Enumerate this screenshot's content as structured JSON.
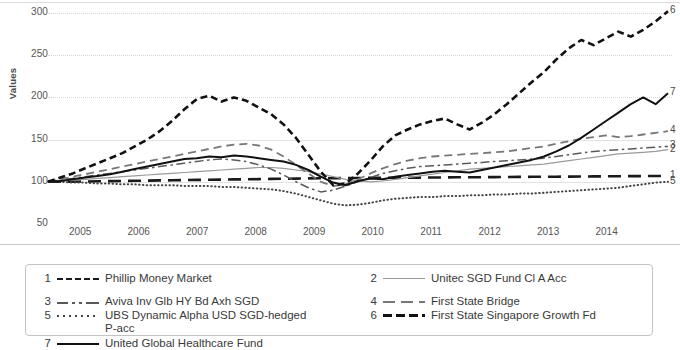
{
  "chart_data": {
    "type": "line",
    "title": "",
    "xlabel": "",
    "ylabel": "Values",
    "ylim": [
      50,
      300
    ],
    "yticks": [
      50,
      100,
      150,
      200,
      250,
      300
    ],
    "xticks": [
      "2005",
      "2006",
      "2007",
      "2008",
      "2009",
      "2010",
      "2011",
      "2012",
      "2013",
      "2014"
    ],
    "grid": true,
    "legend_position": "bottom",
    "x_start": "2004",
    "x_end": "2015",
    "series": [
      {
        "name": "Phillip Money Market",
        "number": "1",
        "style": "long-dash",
        "color": "#1a1a1a",
        "end_label": "1",
        "end_value": 107,
        "values": [
          100,
          100,
          100.2,
          100.4,
          100.6,
          100.8,
          101,
          101.2,
          101.4,
          101.6,
          101.8,
          102,
          102.2,
          102.4,
          102.6,
          102.8,
          103,
          103.2,
          103.4,
          103.6,
          103.8,
          104,
          104.2,
          104.3,
          104.4,
          104.5,
          104.6,
          104.7,
          104.8,
          104.9,
          105,
          105.1,
          105.2,
          105.3,
          105.4,
          105.5,
          105.6,
          105.7,
          105.8,
          105.9,
          106,
          106.1,
          106.2,
          106.3,
          106.4,
          106.5,
          106.6,
          106.7,
          106.8,
          106.9,
          107
        ]
      },
      {
        "name": "Unitec SGD Fund Cl A Acc",
        "number": "2",
        "style": "thin-solid",
        "color": "#9a9a9a",
        "end_label": "2",
        "end_value": 138,
        "values": [
          100,
          101,
          102,
          103,
          104,
          105,
          106,
          107,
          108,
          109,
          110,
          111,
          112,
          113,
          114,
          115,
          116,
          117,
          117,
          116,
          114,
          112,
          109,
          106,
          103,
          101,
          100,
          101,
          103,
          105,
          107,
          109,
          111,
          113,
          115,
          116,
          117,
          118,
          119,
          120,
          121,
          123,
          125,
          127,
          129,
          131,
          133,
          134,
          135,
          136,
          138
        ]
      },
      {
        "name": "Aviva Inv Glb HY Bd Axh SGD",
        "number": "3",
        "style": "dash-dot",
        "color": "#5a5a5a",
        "end_label": "3",
        "end_value": 142,
        "values": [
          100,
          102,
          104,
          106,
          108,
          110,
          112,
          114,
          116,
          118,
          120,
          122,
          124,
          126,
          127,
          126,
          124,
          120,
          115,
          108,
          100,
          93,
          88,
          90,
          95,
          100,
          105,
          110,
          113,
          116,
          118,
          119,
          120,
          121,
          122,
          123,
          124,
          125,
          126,
          127,
          128,
          130,
          132,
          134,
          136,
          137,
          138,
          139,
          140,
          141,
          142
        ]
      },
      {
        "name": "First State Bridge",
        "number": "4",
        "style": "med-dash",
        "color": "#777777",
        "end_label": "4",
        "end_value": 160,
        "values": [
          100,
          103,
          106,
          109,
          112,
          115,
          118,
          121,
          124,
          127,
          130,
          133,
          136,
          139,
          142,
          144,
          145,
          143,
          138,
          130,
          120,
          110,
          100,
          95,
          97,
          103,
          110,
          116,
          121,
          125,
          128,
          130,
          131,
          132,
          133,
          134,
          135,
          136,
          138,
          140,
          142,
          145,
          148,
          151,
          153,
          155,
          153,
          154,
          156,
          158,
          160
        ]
      },
      {
        "name": "UBS Dynamic Alpha USD SGD-hedged P-acc",
        "number": "5",
        "style": "dotted",
        "color": "#444444",
        "end_label": "5",
        "end_value": 100,
        "values": [
          100,
          100,
          99,
          99,
          98,
          98,
          97,
          97,
          96,
          96,
          96,
          95,
          95,
          95,
          94,
          94,
          93,
          92,
          91,
          89,
          86,
          82,
          78,
          74,
          72,
          73,
          75,
          78,
          80,
          81,
          82,
          82,
          83,
          83,
          84,
          84,
          85,
          85,
          86,
          86,
          87,
          88,
          89,
          90,
          91,
          92,
          93,
          95,
          97,
          99,
          100
        ]
      },
      {
        "name": "First State Singapore Growth Fd",
        "number": "6",
        "style": "bold-dash",
        "color": "#111111",
        "end_label": "6",
        "end_value": 302,
        "values": [
          100,
          105,
          110,
          116,
          122,
          128,
          134,
          142,
          150,
          160,
          172,
          186,
          198,
          202,
          195,
          200,
          196,
          188,
          180,
          168,
          152,
          132,
          112,
          96,
          98,
          110,
          125,
          142,
          155,
          162,
          168,
          172,
          175,
          168,
          162,
          170,
          180,
          192,
          205,
          218,
          230,
          245,
          258,
          268,
          262,
          270,
          278,
          272,
          280,
          290,
          302
        ]
      },
      {
        "name": "United Global Healthcare Fund",
        "number": "7",
        "style": "solid",
        "color": "#111111",
        "end_label": "7",
        "end_value": 205,
        "values": [
          100,
          101,
          103,
          105,
          107,
          109,
          112,
          115,
          118,
          121,
          124,
          127,
          128,
          130,
          129,
          131,
          130,
          128,
          126,
          124,
          120,
          114,
          106,
          99,
          96,
          101,
          104,
          103,
          106,
          108,
          110,
          112,
          113,
          112,
          111,
          114,
          117,
          120,
          123,
          126,
          130,
          136,
          143,
          152,
          162,
          172,
          182,
          192,
          200,
          192,
          205
        ]
      }
    ]
  },
  "legend": {
    "items": [
      {
        "number": "1",
        "label": "Phillip Money Market",
        "style": "s-longdash",
        "cont": ""
      },
      {
        "number": "2",
        "label": "Unitec SGD Fund Cl A Acc",
        "style": "s-thin",
        "cont": ""
      },
      {
        "number": "3",
        "label": "Aviva Inv Glb HY Bd Axh SGD",
        "style": "s-dashdot",
        "cont": ""
      },
      {
        "number": "4",
        "label": "First State Bridge",
        "style": "s-meddash",
        "cont": ""
      },
      {
        "number": "5",
        "label": "UBS Dynamic Alpha USD SGD-hedged",
        "style": "s-dotted",
        "cont": "P-acc"
      },
      {
        "number": "6",
        "label": "First State Singapore Growth Fd",
        "style": "s-bolddash",
        "cont": ""
      },
      {
        "number": "7",
        "label": "United Global Healthcare Fund",
        "style": "s-solid",
        "cont": ""
      }
    ]
  },
  "axis": {
    "ylabel": "Values",
    "yticks": [
      "300",
      "250",
      "200",
      "150",
      "100",
      "50"
    ],
    "xticks": [
      "2005",
      "2006",
      "2007",
      "2008",
      "2009",
      "2010",
      "2011",
      "2012",
      "2013",
      "2014"
    ]
  },
  "end_labels": [
    "6",
    "7",
    "4",
    "3",
    "2",
    "1",
    "5"
  ]
}
